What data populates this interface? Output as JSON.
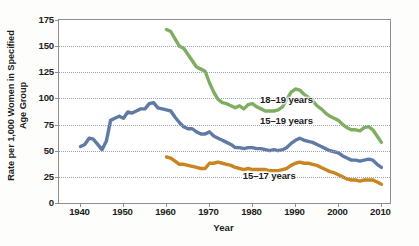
{
  "chart_data": {
    "type": "line",
    "title": "",
    "xlabel": "Year",
    "ylabel_line1": "Rate per 1,000 Women in Specified",
    "ylabel_line2": "Age Group",
    "xlim": [
      1935,
      2012
    ],
    "ylim": [
      0,
      175
    ],
    "ytick_values": [
      0,
      25,
      50,
      75,
      100,
      125,
      150,
      175
    ],
    "ytick_labels": [
      "0",
      "25",
      "50",
      "75",
      "100",
      "125",
      "150",
      "175"
    ],
    "xtick_values": [
      1940,
      1950,
      1960,
      1970,
      1980,
      1990,
      2000,
      2010
    ],
    "xtick_labels": [
      "1940",
      "1950",
      "1960",
      "1970",
      "1980",
      "1990",
      "2000",
      "2010"
    ],
    "grid": "horizontal-dotted",
    "legend_position": "inline-annotations",
    "series": [
      {
        "name": "18–19 years",
        "color": "#7fae63",
        "label_x": 1982,
        "label_y": 98,
        "points": [
          [
            1960,
            166
          ],
          [
            1961,
            164
          ],
          [
            1962,
            157
          ],
          [
            1963,
            150
          ],
          [
            1964,
            148
          ],
          [
            1965,
            142
          ],
          [
            1966,
            136
          ],
          [
            1967,
            130
          ],
          [
            1968,
            128
          ],
          [
            1969,
            126
          ],
          [
            1970,
            115
          ],
          [
            1971,
            106
          ],
          [
            1972,
            99
          ],
          [
            1973,
            96
          ],
          [
            1974,
            95
          ],
          [
            1975,
            93
          ],
          [
            1976,
            91
          ],
          [
            1977,
            93
          ],
          [
            1978,
            90
          ],
          [
            1979,
            94
          ],
          [
            1980,
            95
          ],
          [
            1981,
            92
          ],
          [
            1982,
            90
          ],
          [
            1983,
            88
          ],
          [
            1984,
            88
          ],
          [
            1985,
            88
          ],
          [
            1986,
            89
          ],
          [
            1987,
            92
          ],
          [
            1988,
            99
          ],
          [
            1989,
            106
          ],
          [
            1990,
            109
          ],
          [
            1991,
            108
          ],
          [
            1992,
            104
          ],
          [
            1993,
            101
          ],
          [
            1994,
            98
          ],
          [
            1995,
            93
          ],
          [
            1996,
            90
          ],
          [
            1997,
            86
          ],
          [
            1998,
            83
          ],
          [
            1999,
            81
          ],
          [
            2000,
            79
          ],
          [
            2001,
            75
          ],
          [
            2002,
            72
          ],
          [
            2003,
            70
          ],
          [
            2004,
            70
          ],
          [
            2005,
            69
          ],
          [
            2006,
            72
          ],
          [
            2007,
            73
          ],
          [
            2008,
            70
          ],
          [
            2009,
            64
          ],
          [
            2010,
            58
          ]
        ]
      },
      {
        "name": "15–19 years",
        "color": "#5f7aa4",
        "label_x": 1982,
        "label_y": 77,
        "points": [
          [
            1940,
            54
          ],
          [
            1941,
            56
          ],
          [
            1942,
            62
          ],
          [
            1943,
            61
          ],
          [
            1944,
            56
          ],
          [
            1945,
            51
          ],
          [
            1946,
            59
          ],
          [
            1947,
            79
          ],
          [
            1948,
            81
          ],
          [
            1949,
            83
          ],
          [
            1950,
            81
          ],
          [
            1951,
            87
          ],
          [
            1952,
            86
          ],
          [
            1953,
            88
          ],
          [
            1954,
            90
          ],
          [
            1955,
            90
          ],
          [
            1956,
            95
          ],
          [
            1957,
            96
          ],
          [
            1958,
            91
          ],
          [
            1959,
            90
          ],
          [
            1960,
            89
          ],
          [
            1961,
            88
          ],
          [
            1962,
            82
          ],
          [
            1963,
            77
          ],
          [
            1964,
            73
          ],
          [
            1965,
            71
          ],
          [
            1966,
            71
          ],
          [
            1967,
            68
          ],
          [
            1968,
            66
          ],
          [
            1969,
            66
          ],
          [
            1970,
            68
          ],
          [
            1971,
            64
          ],
          [
            1972,
            62
          ],
          [
            1973,
            60
          ],
          [
            1974,
            58
          ],
          [
            1975,
            56
          ],
          [
            1976,
            53
          ],
          [
            1977,
            53
          ],
          [
            1978,
            52
          ],
          [
            1979,
            53
          ],
          [
            1980,
            53
          ],
          [
            1981,
            52
          ],
          [
            1982,
            52
          ],
          [
            1983,
            51
          ],
          [
            1984,
            50
          ],
          [
            1985,
            51
          ],
          [
            1986,
            50
          ],
          [
            1987,
            51
          ],
          [
            1988,
            53
          ],
          [
            1989,
            57
          ],
          [
            1990,
            60
          ],
          [
            1991,
            62
          ],
          [
            1992,
            60
          ],
          [
            1993,
            59
          ],
          [
            1994,
            58
          ],
          [
            1995,
            56
          ],
          [
            1996,
            54
          ],
          [
            1997,
            52
          ],
          [
            1998,
            50
          ],
          [
            1999,
            49
          ],
          [
            2000,
            48
          ],
          [
            2001,
            45
          ],
          [
            2002,
            43
          ],
          [
            2003,
            41
          ],
          [
            2004,
            41
          ],
          [
            2005,
            40
          ],
          [
            2006,
            41
          ],
          [
            2007,
            42
          ],
          [
            2008,
            41
          ],
          [
            2009,
            37
          ],
          [
            2010,
            34
          ]
        ]
      },
      {
        "name": "15–17 years",
        "color": "#c9851f",
        "label_x": 1978,
        "label_y": 25,
        "points": [
          [
            1960,
            44
          ],
          [
            1961,
            43
          ],
          [
            1962,
            40
          ],
          [
            1963,
            37
          ],
          [
            1964,
            37
          ],
          [
            1965,
            36
          ],
          [
            1966,
            35
          ],
          [
            1967,
            34
          ],
          [
            1968,
            33
          ],
          [
            1969,
            33
          ],
          [
            1970,
            38
          ],
          [
            1971,
            38
          ],
          [
            1972,
            39
          ],
          [
            1973,
            38
          ],
          [
            1974,
            37
          ],
          [
            1975,
            36
          ],
          [
            1976,
            34
          ],
          [
            1977,
            33
          ],
          [
            1978,
            32
          ],
          [
            1979,
            33
          ],
          [
            1980,
            32
          ],
          [
            1981,
            32
          ],
          [
            1982,
            32
          ],
          [
            1983,
            32
          ],
          [
            1984,
            31
          ],
          [
            1985,
            31
          ],
          [
            1986,
            31
          ],
          [
            1987,
            32
          ],
          [
            1988,
            33
          ],
          [
            1989,
            36
          ],
          [
            1990,
            38
          ],
          [
            1991,
            39
          ],
          [
            1992,
            38
          ],
          [
            1993,
            38
          ],
          [
            1994,
            37
          ],
          [
            1995,
            36
          ],
          [
            1996,
            34
          ],
          [
            1997,
            32
          ],
          [
            1998,
            30
          ],
          [
            1999,
            29
          ],
          [
            2000,
            27
          ],
          [
            2001,
            25
          ],
          [
            2002,
            23
          ],
          [
            2003,
            22
          ],
          [
            2004,
            22
          ],
          [
            2005,
            21
          ],
          [
            2006,
            22
          ],
          [
            2007,
            22
          ],
          [
            2008,
            22
          ],
          [
            2009,
            20
          ],
          [
            2010,
            18
          ]
        ]
      }
    ]
  },
  "axes": {
    "frame_color": "#8e8e8e",
    "grid_color": "#9aa3ae"
  }
}
